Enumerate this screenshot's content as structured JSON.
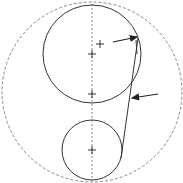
{
  "diagram": {
    "background": "#ffffff",
    "stroke_color": "#333333",
    "dashed_color": "#888888",
    "outer_circle": {
      "cx": 92,
      "cy": 92,
      "r": 90,
      "style": "dashed"
    },
    "axis_line": {
      "x": 92,
      "y1": 4,
      "y2": 181,
      "style": "dashed"
    },
    "large_circle": {
      "cx": 92,
      "cy": 54,
      "r": 49
    },
    "small_circle": {
      "cx": 92,
      "cy": 150,
      "r": 30
    },
    "center_marks": [
      {
        "x": 92,
        "y": 54
      },
      {
        "x": 100,
        "y": 44
      },
      {
        "x": 92,
        "y": 94
      },
      {
        "x": 92,
        "y": 150
      }
    ],
    "tangent_line": {
      "x1": 138,
      "y1": 38,
      "x2": 121,
      "y2": 158
    },
    "inner_arc_segment": {
      "x1": 136,
      "y1": 40,
      "x2": 137,
      "y2": 54
    },
    "arrows": [
      {
        "x1": 113,
        "y1": 42,
        "x2": 137,
        "y2": 37
      },
      {
        "x1": 158,
        "y1": 94,
        "x2": 132,
        "y2": 98
      }
    ]
  }
}
